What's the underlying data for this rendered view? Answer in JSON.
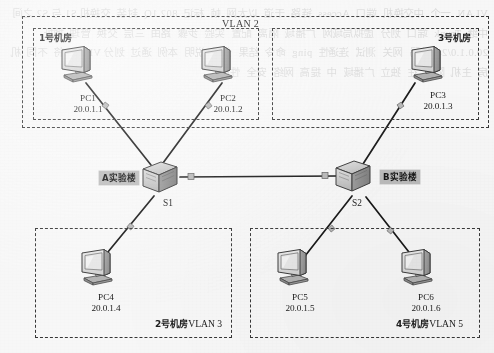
{
  "diagram": {
    "type": "network-topology"
  },
  "regions": {
    "vlan2_outer": {
      "label": "VLAN 2"
    },
    "room1": {
      "label": "1号机房"
    },
    "room3": {
      "label": "3号机房"
    },
    "room2": {
      "label_cn": "2号机房",
      "label_vlan": "VLAN 3"
    },
    "room4": {
      "label_cn": "4号机房",
      "label_vlan": "VLAN 5"
    }
  },
  "hosts": [
    {
      "id": "pc1",
      "name": "PC1",
      "ip": "20.0.1.1",
      "icon": "desktop-computer-icon"
    },
    {
      "id": "pc2",
      "name": "PC2",
      "ip": "20.0.1.2",
      "icon": "desktop-computer-icon"
    },
    {
      "id": "pc3",
      "name": "PC3",
      "ip": "20.0.1.3",
      "icon": "desktop-computer-icon"
    },
    {
      "id": "pc4",
      "name": "PC4",
      "ip": "20.0.1.4",
      "icon": "desktop-computer-icon"
    },
    {
      "id": "pc5",
      "name": "PC5",
      "ip": "20.0.1.5",
      "icon": "desktop-computer-icon"
    },
    {
      "id": "pc6",
      "name": "PC6",
      "ip": "20.0.1.6",
      "icon": "desktop-computer-icon"
    }
  ],
  "switches": [
    {
      "id": "s1",
      "name": "S1",
      "building": "A实验楼",
      "icon": "switch-icon"
    },
    {
      "id": "s2",
      "name": "S2",
      "building": "B实验楼",
      "icon": "switch-icon"
    }
  ],
  "links": [
    {
      "from": "pc1",
      "to": "s1"
    },
    {
      "from": "pc2",
      "to": "s1"
    },
    {
      "from": "pc4",
      "to": "s1"
    },
    {
      "from": "pc3",
      "to": "s2"
    },
    {
      "from": "pc5",
      "to": "s2"
    },
    {
      "from": "pc6",
      "to": "s2"
    },
    {
      "from": "s1",
      "to": "s2",
      "kind": "trunk"
    }
  ],
  "colors": {
    "line": "#1d1d1d",
    "dash_border": "#3a3a3a",
    "tag_fill": "#b9b9b9",
    "page_bg": "#f3f2f0"
  },
  "bleed_text": "VLAN  一个  中交换机  端口  Access  链路  干道  以太网  帧  标记  802.1Q  封装  交换机 S1 与 S2 之间  中继  Trunk  端口  划分  虚拟局域网  广播域  隔离  配置  实验  步骤  路由  三层  交换  管理  地址  20.0.1.0/24  掩码  网关  测试  连通性  ping  命令  结果  分析  说明  本例  通过  划分 VLAN  将  不同  机房  主机  隔离  在  独立  广播域  中  提高  网络  安全  性能"
}
